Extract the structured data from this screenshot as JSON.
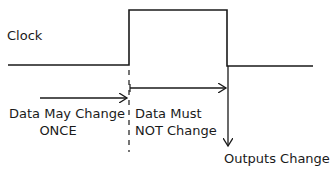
{
  "diagram": {
    "type": "timing-diagram",
    "signal_label": "Clock",
    "annotations": {
      "before_edge_line1": "Data May Change",
      "before_edge_line2": "ONCE",
      "during_high_line1": "Data Must",
      "during_high_line2": "NOT Change",
      "after_fall": "Outputs Change"
    },
    "colors": {
      "stroke": "#1a1a1a",
      "background": "#ffffff"
    }
  }
}
